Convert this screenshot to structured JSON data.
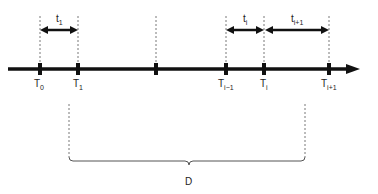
{
  "diagram": {
    "type": "timeline",
    "axis": {
      "y": 69,
      "x_start": 8,
      "x_end": 358,
      "color": "#111111"
    },
    "ticks": [
      {
        "x": 40,
        "label": "T",
        "sub": "0"
      },
      {
        "x": 78,
        "label": "T",
        "sub": "1"
      },
      {
        "x": 156,
        "label": "",
        "sub": ""
      },
      {
        "x": 226,
        "label": "T",
        "sub": "i−1"
      },
      {
        "x": 264,
        "label": "T",
        "sub": "i"
      },
      {
        "x": 329,
        "label": "T",
        "sub": "i+1"
      }
    ],
    "intervals": [
      {
        "from": 40,
        "to": 78,
        "label": "t",
        "sub": "1"
      },
      {
        "from": 226,
        "to": 264,
        "label": "t",
        "sub": "i"
      },
      {
        "from": 264,
        "to": 329,
        "label": "t",
        "sub": "i+1"
      }
    ],
    "brace": {
      "from": 69,
      "to": 305,
      "y": 161,
      "label": "D"
    }
  }
}
